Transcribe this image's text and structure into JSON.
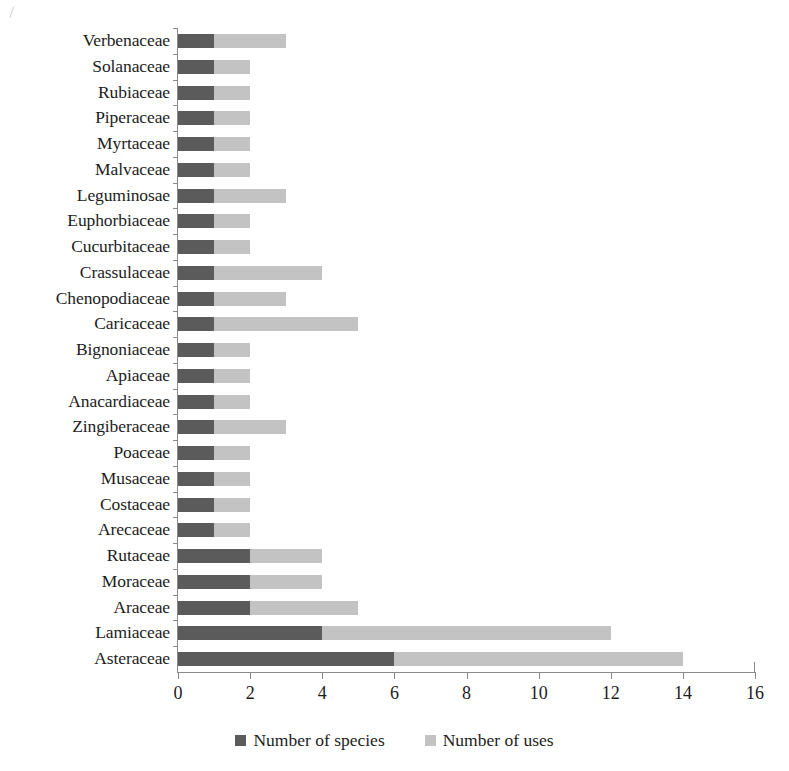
{
  "chart_data": {
    "type": "bar",
    "orientation": "horizontal",
    "stacked": true,
    "title": "",
    "subtitle": "",
    "xlabel": "",
    "ylabel": "",
    "xlim": [
      0,
      16
    ],
    "xticks": [
      0,
      2,
      4,
      6,
      8,
      10,
      12,
      14,
      16
    ],
    "xtick_labels": [
      "0",
      "2",
      "4",
      "6",
      "8",
      "10",
      "12",
      "14",
      "16"
    ],
    "grid": false,
    "legend_position": "bottom",
    "categories": [
      "Verbenaceae",
      "Solanaceae",
      "Rubiaceae",
      "Piperaceae",
      "Myrtaceae",
      "Malvaceae",
      "Leguminosae",
      "Euphorbiaceae",
      "Cucurbitaceae",
      "Crassulaceae",
      "Chenopodiaceae",
      "Caricaceae",
      "Bignoniaceae",
      "Apiaceae",
      "Anacardiaceae",
      "Zingiberaceae",
      "Poaceae",
      "Musaceae",
      "Costaceae",
      "Arecaceae",
      "Rutaceae",
      "Moraceae",
      "Araceae",
      "Lamiaceae",
      "Asteraceae"
    ],
    "series": [
      {
        "name": "Number of species",
        "color": "#5b5b5b",
        "values": [
          1,
          1,
          1,
          1,
          1,
          1,
          1,
          1,
          1,
          1,
          1,
          1,
          1,
          1,
          1,
          1,
          1,
          1,
          1,
          1,
          2,
          2,
          2,
          4,
          6
        ]
      },
      {
        "name": "Number of uses",
        "color": "#c3c3c3",
        "values": [
          2,
          1,
          1,
          1,
          1,
          1,
          2,
          1,
          1,
          3,
          2,
          4,
          1,
          1,
          1,
          2,
          1,
          1,
          1,
          1,
          2,
          2,
          3,
          8,
          8
        ]
      }
    ]
  },
  "legend": {
    "items": [
      {
        "label": "Number of species",
        "color": "#5b5b5b"
      },
      {
        "label": "Number of uses",
        "color": "#c3c3c3"
      }
    ]
  }
}
